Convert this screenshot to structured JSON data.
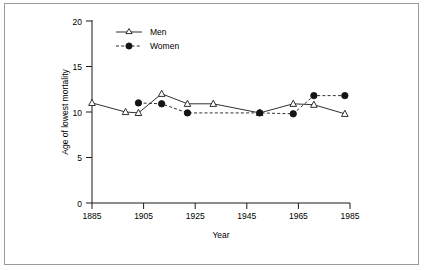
{
  "figure": {
    "background_color": "#ffffff",
    "frame_color": "#9a9a9a",
    "line_color": "#1a1a1a"
  },
  "chart_data": {
    "type": "line",
    "title": "",
    "xlabel": "Year",
    "ylabel": "Age of lowest mortality",
    "xlim": [
      1885,
      1985
    ],
    "ylim": [
      0,
      20
    ],
    "xticks": [
      1885,
      1905,
      1925,
      1945,
      1965,
      1985
    ],
    "yticks": [
      0,
      5,
      10,
      15,
      20
    ],
    "xtick_labels": [
      "1885",
      "1905",
      "1925",
      "1945",
      "1965",
      "1985"
    ],
    "ytick_labels": [
      "0",
      "5",
      "10",
      "15",
      "20"
    ],
    "grid": false,
    "legend_position": "top-left",
    "series": [
      {
        "name": "Men",
        "marker": "open-triangle",
        "linestyle": "solid",
        "color": "#1a1a1a",
        "x": [
          1885,
          1898,
          1903,
          1912,
          1922,
          1932,
          1950,
          1963,
          1971,
          1983
        ],
        "y": [
          11.0,
          10.0,
          9.9,
          12.0,
          10.9,
          10.9,
          9.9,
          10.9,
          10.8,
          9.8
        ]
      },
      {
        "name": "Women",
        "marker": "filled-circle",
        "linestyle": "dashed",
        "color": "#141414",
        "x": [
          1903,
          1912,
          1922,
          1950,
          1963,
          1971,
          1983
        ],
        "y": [
          11.0,
          10.9,
          9.9,
          9.9,
          9.8,
          11.8,
          11.8
        ]
      }
    ]
  },
  "legend": {
    "entries": [
      {
        "label": "Men"
      },
      {
        "label": "Women"
      }
    ]
  }
}
